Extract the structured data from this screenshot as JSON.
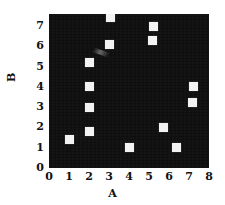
{
  "chart_data": {
    "type": "scatter",
    "title": "",
    "xlabel": "A",
    "ylabel": "B",
    "xlim": [
      0,
      8
    ],
    "ylim": [
      0,
      7.6
    ],
    "xticks": [
      "0",
      "1",
      "2",
      "3",
      "4",
      "5",
      "6",
      "7",
      "8"
    ],
    "yticks": [
      "0",
      "1",
      "2",
      "3",
      "4",
      "5",
      "6",
      "7"
    ],
    "grid": false,
    "legend": null,
    "marker": "square",
    "marker_color": "#f2f2f2",
    "plot_background": "#0d0d0d",
    "figure_background": "#ffffff",
    "points": [
      {
        "x": 1.0,
        "y": 1.4
      },
      {
        "x": 2.0,
        "y": 1.8
      },
      {
        "x": 2.0,
        "y": 3.0
      },
      {
        "x": 2.0,
        "y": 4.0
      },
      {
        "x": 2.0,
        "y": 5.2
      },
      {
        "x": 3.0,
        "y": 6.1
      },
      {
        "x": 3.05,
        "y": 7.45
      },
      {
        "x": 4.0,
        "y": 1.0
      },
      {
        "x": 5.15,
        "y": 6.3
      },
      {
        "x": 5.2,
        "y": 7.0
      },
      {
        "x": 5.7,
        "y": 2.0
      },
      {
        "x": 6.35,
        "y": 1.0
      },
      {
        "x": 7.15,
        "y": 3.25
      },
      {
        "x": 7.2,
        "y": 4.0
      }
    ]
  },
  "axes": {
    "x_tick_labels": [
      "0",
      "1",
      "2",
      "3",
      "4",
      "5",
      "6",
      "7",
      "8"
    ],
    "y_tick_labels": [
      "0",
      "1",
      "2",
      "3",
      "4",
      "5",
      "6",
      "7"
    ],
    "x_axis_title": "A",
    "y_axis_title": "B"
  }
}
